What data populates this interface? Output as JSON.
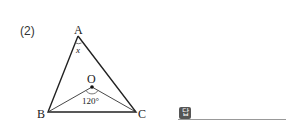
{
  "problem": {
    "number": "(2)",
    "vertices": {
      "A": "A",
      "B": "B",
      "C": "C",
      "O": "O"
    },
    "angle_at_A": "x",
    "angle_BOC": "120°"
  },
  "answer": {
    "icon_label": "답",
    "value": ""
  }
}
